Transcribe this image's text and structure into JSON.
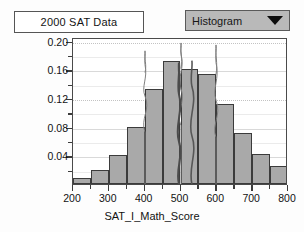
{
  "window": {
    "title_box_label": "2000 SAT Data"
  },
  "toolbar": {
    "plot_type_selected": "Histogram",
    "plot_type_options": [
      "Histogram"
    ],
    "dropdown_icon": "chevron-down-icon"
  },
  "chart_data": {
    "type": "bar",
    "title": "2000 SAT Data",
    "xlabel": "SAT_I_Math_Score",
    "ylabel": "Relative Frequency",
    "xlim": [
      200,
      800
    ],
    "ylim": [
      0,
      0.205
    ],
    "bin_width": 50,
    "grid": true,
    "legend": "none",
    "x_ticks": [
      200,
      300,
      400,
      500,
      600,
      700,
      800
    ],
    "x_tick_labels": [
      "200",
      "300",
      "400",
      "500",
      "600",
      "700",
      "800"
    ],
    "x_minor_ticks": [
      250,
      350,
      450,
      550,
      650,
      750
    ],
    "y_ticks": [
      0.04,
      0.08,
      0.12,
      0.16,
      0.2
    ],
    "y_tick_labels": [
      "0.04",
      "0.08",
      "0.12",
      "0.16",
      "0.20"
    ],
    "bin_starts": [
      200,
      250,
      300,
      350,
      400,
      450,
      500,
      550,
      600,
      650,
      700,
      750
    ],
    "categories": [
      "200-250",
      "250-300",
      "300-350",
      "350-400",
      "400-450",
      "450-500",
      "500-550",
      "550-600",
      "600-650",
      "650-700",
      "700-750",
      "750-800"
    ],
    "values": [
      0.009,
      0.019,
      0.041,
      0.08,
      0.132,
      0.172,
      0.161,
      0.154,
      0.112,
      0.071,
      0.042,
      0.025
    ],
    "annotation_lines": [
      400,
      500,
      600
    ],
    "annotation_note": "three thin vertical marker traces overlaid on the histogram",
    "bar_fill": "#a9a9a9",
    "bar_stroke": "#3b3b3b",
    "grid_color": "#d9d9d9"
  },
  "colors": {
    "background": "#fdfdfd",
    "frame": "#4a4a4a",
    "dropdown_bg": "#b9b9b9",
    "text": "#121212"
  }
}
